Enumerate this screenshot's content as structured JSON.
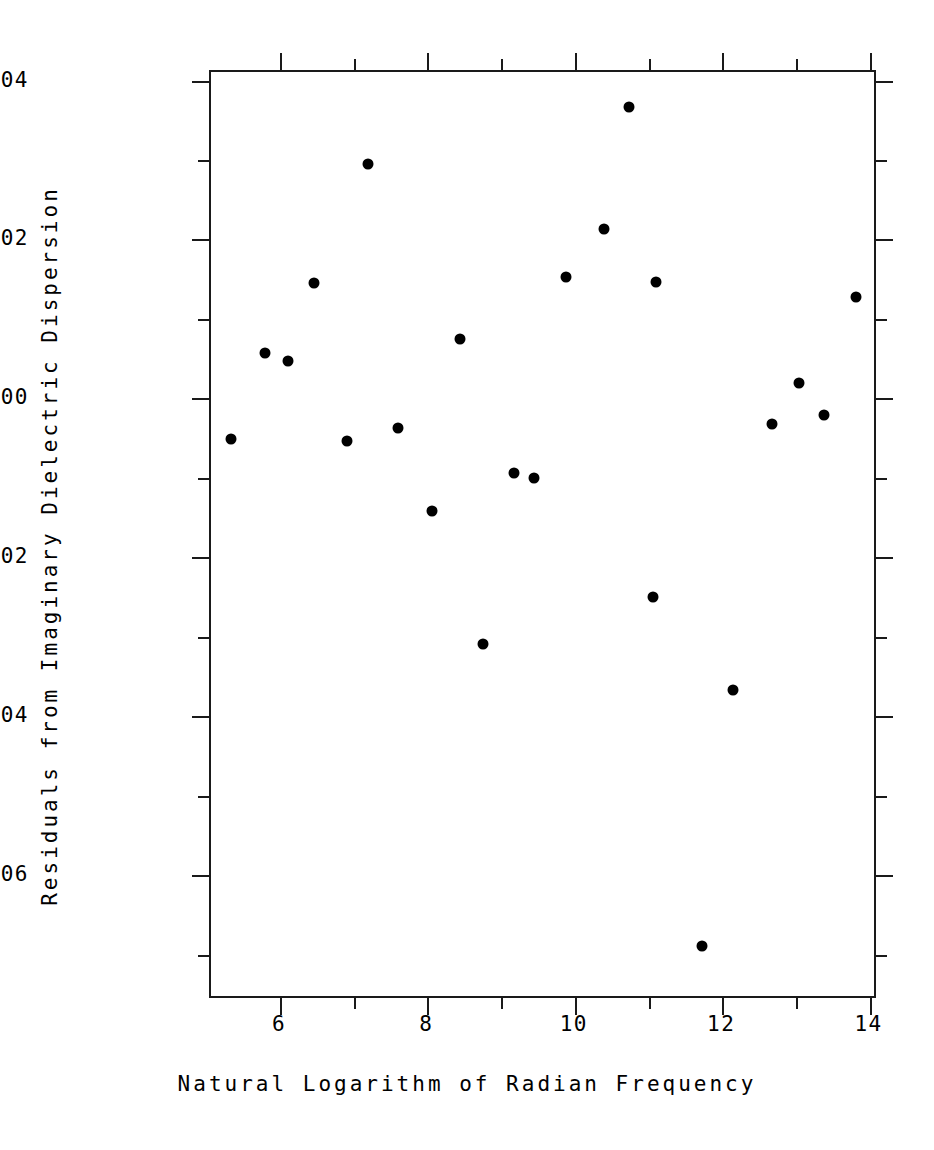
{
  "chart_data": {
    "type": "scatter",
    "title": "",
    "xlabel": "Natural Logarithm of Radian Frequency",
    "ylabel": "Residuals from Imaginary Dielectric Dispersion",
    "xlim": [
      5.05,
      14.1
    ],
    "ylim": [
      -0.00756,
      0.00412
    ],
    "grid": false,
    "legend": null,
    "xticks": [
      6,
      8,
      10,
      12,
      14
    ],
    "xtick_labels": [
      "6",
      "8",
      "10",
      "12",
      "14"
    ],
    "xticks_minor": [
      5,
      7,
      9,
      11,
      13
    ],
    "yticks": [
      0.004,
      0.002,
      0.0,
      -0.002,
      -0.004,
      -0.006
    ],
    "ytick_labels": [
      "0. 004",
      "0. 002",
      "0. 000",
      "-0. 002",
      "-0. 004",
      "-0. 006"
    ],
    "yticks_minor": [
      0.003,
      0.001,
      -0.001,
      -0.003,
      -0.005,
      -0.007
    ],
    "marker": "filled-circle",
    "marker_color": "#000000",
    "marker_size_px": 11,
    "n_points": 23,
    "points": [
      {
        "x": 5.35,
        "y": -0.00053
      },
      {
        "x": 5.81,
        "y": 0.00056
      },
      {
        "x": 6.12,
        "y": 0.00046
      },
      {
        "x": 6.47,
        "y": 0.00144
      },
      {
        "x": 6.92,
        "y": -0.00055
      },
      {
        "x": 7.21,
        "y": 0.00294
      },
      {
        "x": 7.61,
        "y": -0.00039
      },
      {
        "x": 8.08,
        "y": -0.00143
      },
      {
        "x": 8.46,
        "y": 0.00074
      },
      {
        "x": 8.77,
        "y": -0.0031
      },
      {
        "x": 9.19,
        "y": -0.00095
      },
      {
        "x": 9.46,
        "y": -0.00101
      },
      {
        "x": 9.9,
        "y": 0.00151
      },
      {
        "x": 10.41,
        "y": 0.00212
      },
      {
        "x": 10.75,
        "y": 0.00366
      },
      {
        "x": 11.08,
        "y": -0.00251
      },
      {
        "x": 11.12,
        "y": 0.00145
      },
      {
        "x": 11.74,
        "y": -0.0069
      },
      {
        "x": 12.16,
        "y": -0.00368
      },
      {
        "x": 12.69,
        "y": -0.00034
      },
      {
        "x": 13.05,
        "y": 0.00018
      },
      {
        "x": 13.4,
        "y": -0.00022
      },
      {
        "x": 13.83,
        "y": 0.00126
      }
    ]
  },
  "axes": {
    "x_title": "Natural Logarithm of Radian Frequency",
    "y_title": "Residuals from Imaginary Dielectric Dispersion"
  }
}
